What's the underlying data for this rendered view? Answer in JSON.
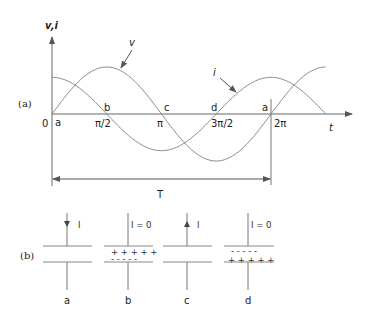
{
  "figure": {
    "part_a": {
      "label": "(a)",
      "y_axis_label": "v,i",
      "x_axis_label": "t",
      "origin_label": "0",
      "tick_labels": [
        "π/2",
        "π",
        "3π/2",
        "2π"
      ],
      "point_labels": [
        "a",
        "b",
        "c",
        "d",
        "a"
      ],
      "curve_v_label": "v",
      "curve_i_label": "i",
      "period_label": "T"
    },
    "part_b": {
      "label": "(b)",
      "capacitors": [
        {
          "id": "a",
          "current_label": "I",
          "direction": "down",
          "top_charge": "",
          "bottom_charge": ""
        },
        {
          "id": "b",
          "current_label": "I = 0",
          "direction": "none",
          "top_charge": "+ + + + +",
          "bottom_charge": "- - - - -"
        },
        {
          "id": "c",
          "current_label": "I",
          "direction": "up",
          "top_charge": "",
          "bottom_charge": ""
        },
        {
          "id": "d",
          "current_label": "I = 0",
          "direction": "none",
          "top_charge": "- - - - -",
          "bottom_charge": "+ + + + +"
        }
      ]
    }
  },
  "chart_data": {
    "type": "line",
    "title": "",
    "xlabel": "t",
    "ylabel": "v,i",
    "x_ticks": [
      "0",
      "π/2",
      "π",
      "3π/2",
      "2π"
    ],
    "x_range_radians": [
      0,
      7.85
    ],
    "series": [
      {
        "name": "v",
        "function": "sin(t)",
        "amplitude": 1.0
      },
      {
        "name": "i",
        "function": "cos(t)",
        "amplitude": 0.78
      }
    ],
    "annotations": [
      "a at 0",
      "b at π/2",
      "c at π",
      "d at 3π/2",
      "a at 2π",
      "T = period from 0 to 2π"
    ],
    "grid": false
  }
}
